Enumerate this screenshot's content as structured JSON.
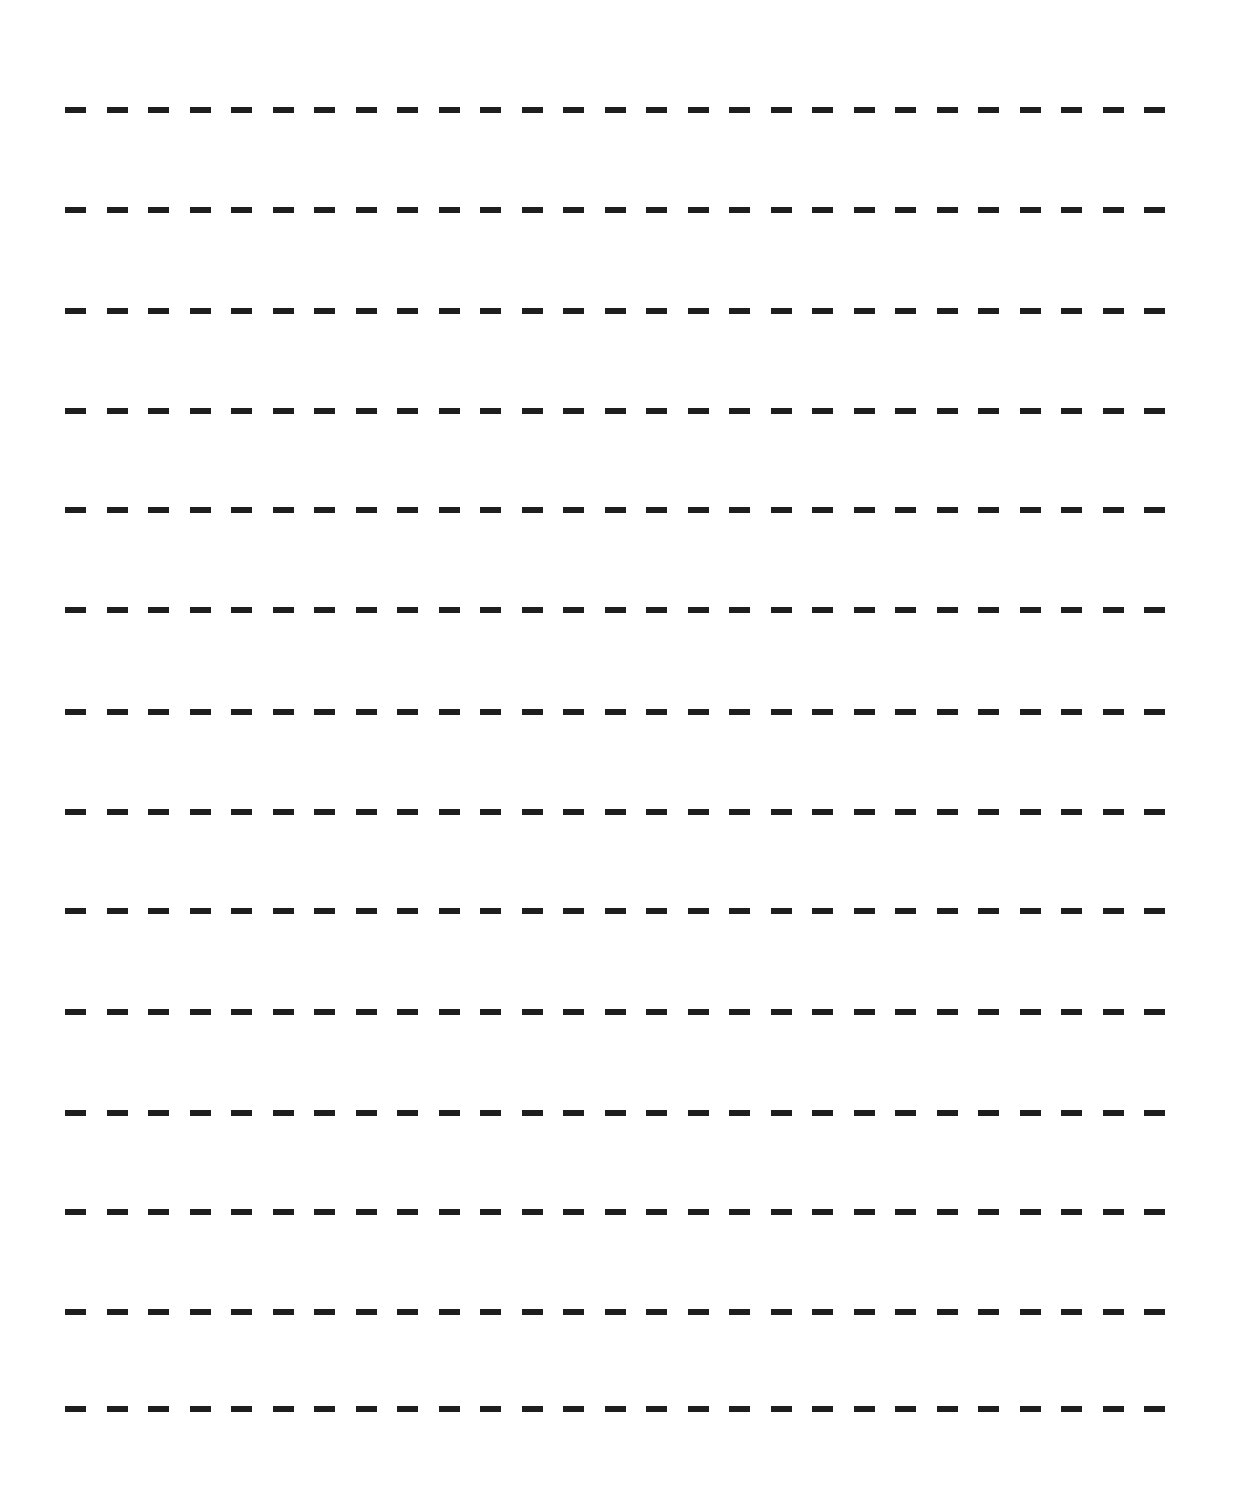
{
  "page": {
    "width": 1233,
    "height": 1506,
    "background_color": "#ffffff",
    "line_color": "#1e1e1e",
    "line_count": 14,
    "dash": {
      "left": 65,
      "line_width": 1103,
      "thickness": 6,
      "dash_length": 21,
      "gap_length": 20.5
    },
    "lines": [
      {
        "y": 110
      },
      {
        "y": 210
      },
      {
        "y": 311
      },
      {
        "y": 411
      },
      {
        "y": 510
      },
      {
        "y": 610
      },
      {
        "y": 712
      },
      {
        "y": 812
      },
      {
        "y": 911
      },
      {
        "y": 1012
      },
      {
        "y": 1113
      },
      {
        "y": 1212
      },
      {
        "y": 1312
      },
      {
        "y": 1409
      }
    ]
  }
}
